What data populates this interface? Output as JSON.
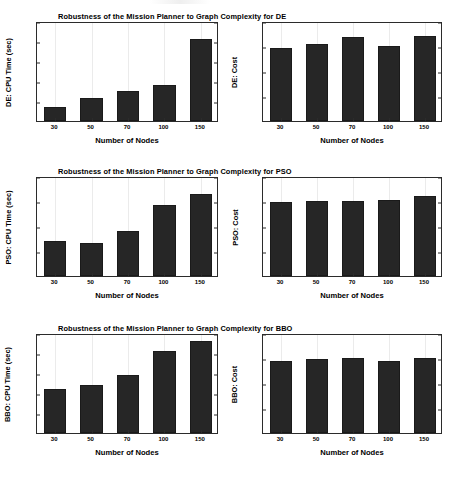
{
  "figure": {
    "width": 454,
    "height": 478,
    "background": "#ffffff",
    "bar_color": "#262626",
    "grid_color": "#ebebeb",
    "axis_color": "#2b2b2b"
  },
  "chart_data": [
    {
      "type": "bar",
      "id": "de-cpu-time",
      "title": "Robustness of the Mission Planner to Graph Complexity for DE",
      "xlabel": "Number of Nodes",
      "ylabel": "DE: CPU Time (sec)",
      "categories": [
        "30",
        "50",
        "70",
        "100",
        "150"
      ],
      "values": [
        7.2,
        11.4,
        14.8,
        18.2,
        40.8
      ],
      "ylim": [
        0,
        50
      ],
      "yticks": [
        "0",
        "10",
        "20",
        "30",
        "40",
        "50"
      ],
      "ytick_values": [
        0,
        10,
        20,
        30,
        40,
        50
      ],
      "grid": true,
      "legend": "none"
    },
    {
      "type": "bar",
      "id": "de-cost",
      "title": "",
      "xlabel": "Number of Nodes",
      "ylabel": "DE: Cost",
      "categories": [
        "30",
        "50",
        "70",
        "100",
        "150"
      ],
      "values": [
        0.585,
        0.613,
        0.672,
        0.601,
        0.681
      ],
      "ylim": [
        0,
        0.8
      ],
      "yticks": [
        "0",
        "0.2",
        "0.4",
        "0.6",
        "0.8"
      ],
      "ytick_values": [
        0,
        0.2,
        0.4,
        0.6,
        0.8
      ],
      "grid": true,
      "legend": "none"
    },
    {
      "type": "bar",
      "id": "pso-cpu-time",
      "title": "Robustness of the Mission Planner to Graph Complexity for PSO",
      "xlabel": "Number of Nodes",
      "ylabel": "PSO: CPU Time (sec)",
      "categories": [
        "30",
        "50",
        "70",
        "100",
        "150"
      ],
      "values": [
        13.9,
        13.3,
        18.2,
        28.4,
        32.9
      ],
      "ylim": [
        0,
        40
      ],
      "yticks": [
        "0",
        "10",
        "20",
        "30",
        "40"
      ],
      "ytick_values": [
        0,
        10,
        20,
        30,
        40
      ],
      "grid": true,
      "legend": "none"
    },
    {
      "type": "bar",
      "id": "pso-cost",
      "title": "",
      "xlabel": "Number of Nodes",
      "ylabel": "PSO: Cost",
      "categories": [
        "30",
        "50",
        "70",
        "100",
        "150"
      ],
      "values": [
        0.591,
        0.598,
        0.601,
        0.612,
        0.639
      ],
      "ylim": [
        0,
        0.8
      ],
      "yticks": [
        "0",
        "0.2",
        "0.4",
        "0.6",
        "0.8"
      ],
      "ytick_values": [
        0,
        0.2,
        0.4,
        0.6,
        0.8
      ],
      "grid": true,
      "legend": "none"
    },
    {
      "type": "bar",
      "id": "bbo-cpu-time",
      "title": "Robustness of the Mission Planner to Graph Complexity for BBO",
      "xlabel": "Number of Nodes",
      "ylabel": "BBO: CPU Time (sec)",
      "categories": [
        "30",
        "50",
        "70",
        "100",
        "150"
      ],
      "values": [
        22.2,
        24.0,
        29.2,
        40.9,
        46.2
      ],
      "ylim": [
        0,
        50
      ],
      "yticks": [
        "0",
        "10",
        "20",
        "30",
        "40",
        "50"
      ],
      "ytick_values": [
        0,
        10,
        20,
        30,
        40,
        50
      ],
      "grid": true,
      "legend": "none"
    },
    {
      "type": "bar",
      "id": "bbo-cost",
      "title": "",
      "xlabel": "Number of Nodes",
      "ylabel": "BBO: Cost",
      "categories": [
        "30",
        "50",
        "70",
        "100",
        "150"
      ],
      "values": [
        0.573,
        0.589,
        0.602,
        0.576,
        0.603
      ],
      "ylim": [
        0,
        0.8
      ],
      "yticks": [
        "0",
        "0.2",
        "0.4",
        "0.6",
        "0.8"
      ],
      "ytick_values": [
        0,
        0.2,
        0.4,
        0.6,
        0.8
      ],
      "grid": true,
      "legend": "none"
    }
  ]
}
